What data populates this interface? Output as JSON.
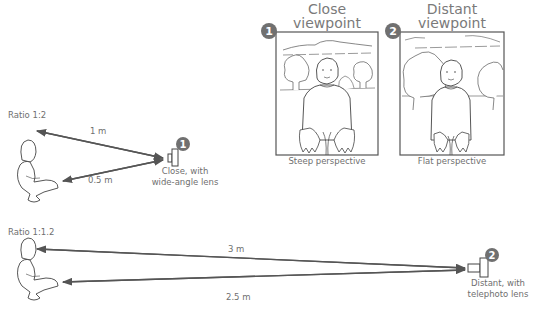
{
  "panels": [
    {
      "badge": "1",
      "title_line1": "Close",
      "title_line2": "viewpoint",
      "caption": "Steep perspective"
    },
    {
      "badge": "2",
      "title_line1": "Distant",
      "title_line2": "viewpoint",
      "caption": "Flat perspective"
    }
  ],
  "setups": [
    {
      "ratio": "Ratio 1:2",
      "distance_head": "1 m",
      "distance_feet": "0.5 m",
      "badge": "1",
      "camera_label_line1": "Close, with",
      "camera_label_line2": "wide-angle lens"
    },
    {
      "ratio": "Ratio 1:1.2",
      "distance_head": "3 m",
      "distance_feet": "2.5 m",
      "badge": "2",
      "camera_label_line1": "Distant, with",
      "camera_label_line2": "telephoto lens"
    }
  ],
  "colors": {
    "line": "#555555",
    "badge": "#707070",
    "text": "#6f6f6f"
  }
}
